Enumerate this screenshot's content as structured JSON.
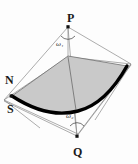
{
  "figure": {
    "type": "geometric-wireframe-diagram",
    "background_color": "#fdfdfd",
    "surface_fill_color": "#c9c9c9",
    "surface_edge_color": "#000000",
    "wireframe_color": "#808080",
    "label_color": "#1a1a1a",
    "vertex_labels": [
      {
        "id": "P",
        "text": "P",
        "x": 68,
        "y": 26,
        "label_x": 67,
        "label_y": 12
      },
      {
        "id": "Q",
        "text": "Q",
        "x": 77,
        "y": 137,
        "label_x": 73,
        "label_y": 146
      },
      {
        "id": "N",
        "text": "N",
        "x": 11,
        "y": 97,
        "label_x": 5,
        "label_y": 74
      },
      {
        "id": "S",
        "text": "S",
        "x": 11,
        "y": 97,
        "label_x": 7,
        "label_y": 103
      }
    ],
    "angle_labels": [
      {
        "id": "omega1",
        "symbol": "ω",
        "subscript": "1",
        "text": "ω₁",
        "apex": "P",
        "x": 56,
        "y": 41
      },
      {
        "id": "omega2",
        "symbol": "ω",
        "subscript": "2",
        "text": "ω₂",
        "apex": "Q",
        "x": 66,
        "y": 113
      }
    ],
    "surface_corners": [
      {
        "id": "left",
        "x": 11,
        "y": 96
      },
      {
        "id": "top",
        "x": 68,
        "y": 56
      },
      {
        "id": "right",
        "x": 128,
        "y": 66
      },
      {
        "id": "bottom",
        "x": 74,
        "y": 112
      }
    ],
    "apex_count": 2,
    "thick_curve_description": "bold curved boundary along the lower-left and lower-right edges of the shaded patch"
  }
}
